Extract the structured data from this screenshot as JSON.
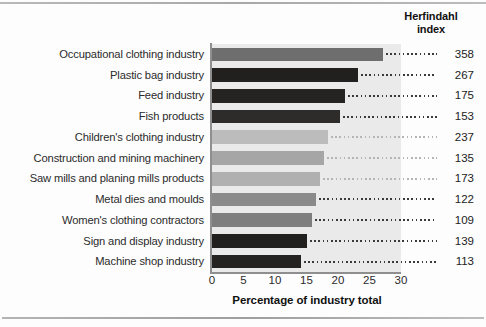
{
  "header": {
    "line1": "Herfindahl",
    "line2": "index"
  },
  "axis": {
    "x_title": "Percentage of industry total",
    "ticks": [
      "0",
      "5",
      "10",
      "15",
      "20",
      "25",
      "30"
    ]
  },
  "chart_data": {
    "type": "bar",
    "orientation": "horizontal",
    "title": "",
    "xlabel": "Percentage of industry total",
    "ylabel": "",
    "xlim": [
      0,
      30
    ],
    "grid": false,
    "legend": null,
    "categories": [
      "Occupational clothing industry",
      "Plastic bag industry",
      "Feed industry",
      "Fish products",
      "Children's clothing industry",
      "Construction and mining machinery",
      "Saw mills and planing mills products",
      "Metal dies and moulds",
      "Women's clothing contractors",
      "Sign and display industry",
      "Machine shop industry"
    ],
    "values": [
      27.2,
      23.2,
      21.1,
      20.3,
      18.4,
      17.8,
      17.1,
      16.5,
      15.8,
      15.1,
      14.2
    ],
    "annotations": {
      "name": "Herfindahl index",
      "values": [
        358,
        267,
        175,
        153,
        237,
        135,
        173,
        122,
        109,
        139,
        113
      ]
    },
    "bar_colors": [
      "#6e6e6e",
      "#221f1f",
      "#262323",
      "#2e2b2b",
      "#bcbcbc",
      "#a6a6a6",
      "#b0b0b0",
      "#8a8a8a",
      "#7e7e7e",
      "#221f1f",
      "#252222"
    ],
    "rows": [
      {
        "label": "Occupational clothing industry",
        "value": 27.2,
        "index": 358,
        "color": "#6e6e6e"
      },
      {
        "label": "Plastic bag industry",
        "value": 23.2,
        "index": 267,
        "color": "#221f1f"
      },
      {
        "label": "Feed industry",
        "value": 21.1,
        "index": 175,
        "color": "#262323"
      },
      {
        "label": "Fish products",
        "value": 20.3,
        "index": 153,
        "color": "#2e2b2b"
      },
      {
        "label": "Children's clothing industry",
        "value": 18.4,
        "index": 237,
        "color": "#bcbcbc"
      },
      {
        "label": "Construction and mining machinery",
        "value": 17.8,
        "index": 135,
        "color": "#a6a6a6"
      },
      {
        "label": "Saw mills and planing mills products",
        "value": 17.1,
        "index": 173,
        "color": "#b0b0b0"
      },
      {
        "label": "Metal dies and moulds",
        "value": 16.5,
        "index": 122,
        "color": "#8a8a8a"
      },
      {
        "label": "Women's clothing contractors",
        "value": 15.8,
        "index": 109,
        "color": "#7e7e7e"
      },
      {
        "label": "Sign and display industry",
        "value": 15.1,
        "index": 139,
        "color": "#221f1f"
      },
      {
        "label": "Machine shop industry",
        "value": 14.2,
        "index": 113,
        "color": "#252222"
      }
    ]
  }
}
